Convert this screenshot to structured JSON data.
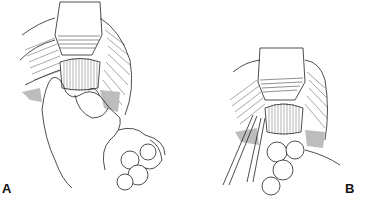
{
  "figure": {
    "type": "surgical line illustration",
    "panels": [
      {
        "label": "A",
        "depicts": "retractor exposing tissue; surgeon's hand manipulating bowel loops"
      },
      {
        "label": "B",
        "depicts": "retractor exposing tissue; forceps/instruments beside bowel loops"
      }
    ],
    "colors": {
      "ink": "#222222",
      "background": "#ffffff",
      "shade": "#bdbdbd"
    }
  }
}
